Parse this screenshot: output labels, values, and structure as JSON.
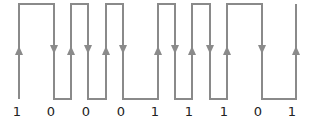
{
  "diagram": {
    "title": "",
    "type": "digital waveform (bit sequence with transition arrows)",
    "line_color": "#8a8a8a",
    "label_color": "#222222",
    "high_y": 4,
    "low_y": 99,
    "bits": [
      "1",
      "0",
      "0",
      "0",
      "1",
      "1",
      "1",
      "0",
      "1"
    ],
    "bit_label_x": [
      17,
      51,
      86,
      121,
      155,
      189,
      224,
      258,
      292
    ],
    "waveform_points": [
      [
        19,
        99
      ],
      [
        19,
        4
      ],
      [
        54,
        4
      ],
      [
        54,
        99
      ],
      [
        71,
        99
      ],
      [
        71,
        4
      ],
      [
        88,
        4
      ],
      [
        88,
        99
      ],
      [
        106,
        99
      ],
      [
        106,
        4
      ],
      [
        123,
        4
      ],
      [
        123,
        99
      ],
      [
        158,
        99
      ],
      [
        158,
        4
      ],
      [
        175,
        4
      ],
      [
        175,
        99
      ],
      [
        192,
        99
      ],
      [
        192,
        4
      ],
      [
        210,
        4
      ],
      [
        210,
        99
      ],
      [
        227,
        99
      ],
      [
        227,
        4
      ],
      [
        262,
        4
      ],
      [
        262,
        99
      ],
      [
        296,
        99
      ],
      [
        296,
        4
      ]
    ],
    "arrows": [
      {
        "x": 19,
        "dir": "up"
      },
      {
        "x": 54,
        "dir": "down"
      },
      {
        "x": 71,
        "dir": "up"
      },
      {
        "x": 88,
        "dir": "down"
      },
      {
        "x": 106,
        "dir": "up"
      },
      {
        "x": 123,
        "dir": "down"
      },
      {
        "x": 158,
        "dir": "up"
      },
      {
        "x": 175,
        "dir": "down"
      },
      {
        "x": 192,
        "dir": "up"
      },
      {
        "x": 210,
        "dir": "down"
      },
      {
        "x": 227,
        "dir": "up"
      },
      {
        "x": 262,
        "dir": "down"
      },
      {
        "x": 296,
        "dir": "up"
      }
    ],
    "arrow_y": 50
  }
}
